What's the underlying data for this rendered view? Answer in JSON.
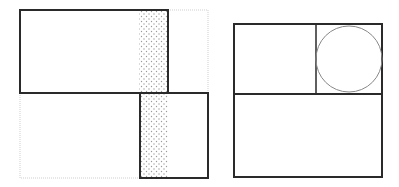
{
  "figures": {
    "left": {
      "description": "Two overlapping rectangles offset diagonally with a shared dotted strip and a dotted bounding outline",
      "top_rect": {
        "x": 20,
        "y": 10,
        "w": 148,
        "h": 83
      },
      "bottom_rect": {
        "x": 140,
        "y": 93,
        "w": 68,
        "h": 85
      },
      "dotted_strip_top": {
        "x": 139,
        "y": 11,
        "w": 29,
        "h": 82
      },
      "dotted_strip_bottom": {
        "x": 141,
        "y": 94,
        "w": 27,
        "h": 84
      },
      "dotted_outline": {
        "x": 20,
        "y": 10,
        "w": 188,
        "h": 168
      }
    },
    "right": {
      "description": "Square divided into a lower rectangle and two upper cells, the right upper cell containing an inscribed circle",
      "outer": {
        "x": 234,
        "y": 24,
        "w": 148,
        "h": 153
      },
      "horizontal_divider_y": 94,
      "vertical_divider_x": 316,
      "circle": {
        "cx": 349,
        "cy": 59,
        "r": 33
      }
    }
  },
  "colors": {
    "stroke": "#2a2a2a",
    "thin_stroke": "#888888",
    "dotted_outline": "#cfcfcf",
    "dot_fill": "#9a9a9a"
  }
}
